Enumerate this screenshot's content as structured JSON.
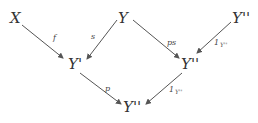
{
  "diagram": {
    "type": "commutative-diagram",
    "nodes": {
      "x": {
        "label": "X",
        "x": 14,
        "y": 22
      },
      "y": {
        "label": "Y",
        "x": 122,
        "y": 22
      },
      "y2_top": {
        "label": "Y''",
        "x": 236,
        "y": 22
      },
      "y1": {
        "label": "Y'",
        "x": 70,
        "y": 69
      },
      "y2_mid": {
        "label": "Y''",
        "x": 181,
        "y": 69
      },
      "y2_bottom": {
        "label": "Y''",
        "x": 123,
        "y": 112
      }
    },
    "arrows": [
      {
        "from": "X",
        "to": "Y'",
        "label": "f"
      },
      {
        "from": "Y",
        "to": "Y'",
        "label": "s"
      },
      {
        "from": "Y",
        "to": "Y''",
        "label": "ps"
      },
      {
        "from": "Y''",
        "to": "Y''",
        "label": "1",
        "label_sub": "Y''"
      },
      {
        "from": "Y'",
        "to": "Y''",
        "label": "p"
      },
      {
        "from": "Y''",
        "to": "Y''",
        "label": "1",
        "label_sub": "Y''"
      }
    ],
    "labels": {
      "f": "f",
      "s": "s",
      "ps": "ps",
      "one_top": "1",
      "one_top_sub": "Y''",
      "p": "p",
      "one_bottom": "1",
      "one_bottom_sub": "Y''"
    },
    "colors": {
      "stroke": "#555555",
      "text": "#333333",
      "background": "#ffffff"
    }
  }
}
